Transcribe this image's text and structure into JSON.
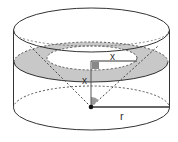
{
  "figure": {
    "type": "geometry-diagram",
    "labels": {
      "x_horizontal": "x",
      "x_vertical": "x",
      "radius": "r"
    },
    "colors": {
      "stroke": "#333333",
      "shade": "#c8c8c8",
      "right_angle_marker": "#888888",
      "angle_marker": "#999999",
      "background": "#ffffff"
    }
  }
}
